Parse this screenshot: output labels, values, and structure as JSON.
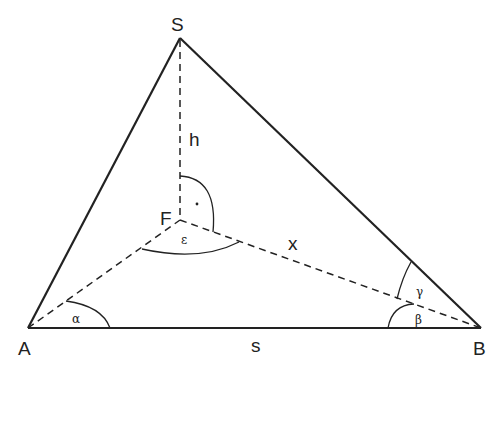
{
  "diagram": {
    "type": "geometry-triangle-pyramid",
    "points": {
      "S": {
        "label": "S",
        "x": 180,
        "y": 38
      },
      "A": {
        "label": "A",
        "x": 28,
        "y": 328
      },
      "B": {
        "label": "B",
        "x": 481,
        "y": 328
      },
      "F": {
        "label": "F",
        "x": 180,
        "y": 220
      }
    },
    "segments": {
      "s": "s",
      "h": "h",
      "x": "x"
    },
    "angles": {
      "alpha": "α",
      "beta": "β",
      "gamma": "γ",
      "epsilon": "ε",
      "right_angle_dot": "·"
    },
    "colors": {
      "stroke": "#222222",
      "background": "#ffffff"
    }
  }
}
